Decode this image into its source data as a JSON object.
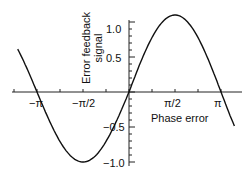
{
  "chart_data": {
    "type": "line",
    "title": "",
    "xlabel": "Phase error",
    "ylabel": "Error feedback signal",
    "ylabel_lines": [
      "Error feedback",
      "signal"
    ],
    "xticks": [
      "−π",
      "−π/2",
      "π/2",
      "π"
    ],
    "yticks": [
      "1.0",
      "0.5",
      "−0.5",
      "−1.0"
    ],
    "xlim": [
      -3.8,
      3.6
    ],
    "ylim": [
      -1.05,
      1.15
    ],
    "series": [
      {
        "name": "error signal",
        "function": "sin(x)",
        "x": [
          -3.8,
          -3.1416,
          -1.5708,
          0,
          1.5708,
          3.1416,
          3.6
        ],
        "y": [
          0.61,
          0,
          -1.0,
          0,
          1.1,
          0,
          -0.45
        ]
      }
    ],
    "grid": false
  }
}
